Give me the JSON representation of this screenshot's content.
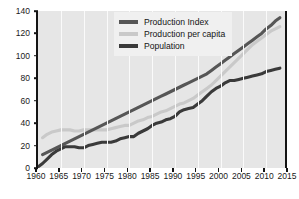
{
  "chart_data": {
    "type": "line",
    "title": "",
    "xlabel": "",
    "ylabel": "Production",
    "xlim": [
      1960,
      2015
    ],
    "ylim": [
      0,
      140
    ],
    "xticks": [
      1960,
      1965,
      1970,
      1975,
      1980,
      1985,
      1990,
      1995,
      2000,
      2005,
      2010,
      2015
    ],
    "yticks": [
      0,
      20,
      40,
      60,
      80,
      100,
      120,
      140
    ],
    "grid": "vertical",
    "legend_position": "top-center",
    "series": [
      {
        "name": "Production Index",
        "color": "#565656",
        "x": [
          1961,
          1962,
          1963,
          1964,
          1965,
          1966,
          1967,
          1968,
          1969,
          1970,
          1971,
          1972,
          1973,
          1974,
          1975,
          1976,
          1977,
          1978,
          1979,
          1980,
          1981,
          1982,
          1983,
          1984,
          1985,
          1986,
          1987,
          1988,
          1989,
          1990,
          1991,
          1992,
          1993,
          1994,
          1995,
          1996,
          1997,
          1998,
          1999,
          2000,
          2001,
          2002,
          2003,
          2004,
          2005,
          2006,
          2007,
          2008,
          2009,
          2010,
          2011,
          2012,
          2013
        ],
        "values": [
          12,
          14,
          16,
          18,
          20,
          22,
          24,
          26,
          28,
          30,
          32,
          34,
          36,
          38,
          40,
          42,
          44,
          46,
          48,
          50,
          52,
          54,
          56,
          58,
          60,
          62,
          64,
          66,
          68,
          70,
          72,
          74,
          76,
          78,
          80,
          82,
          84,
          87,
          90,
          93,
          96,
          99,
          102,
          105,
          108,
          111,
          114,
          117,
          120,
          124,
          127,
          131,
          134
        ]
      },
      {
        "name": "Production per capita",
        "color": "#c9c9c9",
        "x": [
          1961,
          1962,
          1963,
          1964,
          1965,
          1966,
          1967,
          1968,
          1969,
          1970,
          1971,
          1972,
          1973,
          1974,
          1975,
          1976,
          1977,
          1978,
          1979,
          1980,
          1981,
          1982,
          1983,
          1984,
          1985,
          1986,
          1987,
          1988,
          1989,
          1990,
          1991,
          1992,
          1993,
          1994,
          1995,
          1996,
          1997,
          1998,
          1999,
          2000,
          2001,
          2002,
          2003,
          2004,
          2005,
          2006,
          2007,
          2008,
          2009,
          2010,
          2011,
          2012,
          2013
        ],
        "values": [
          27,
          30,
          32,
          33,
          34,
          34,
          34,
          33,
          33,
          34,
          34,
          34,
          34,
          34,
          34,
          35,
          36,
          37,
          38,
          38,
          40,
          42,
          43,
          45,
          46,
          48,
          50,
          51,
          53,
          55,
          57,
          58,
          60,
          62,
          65,
          68,
          71,
          74,
          78,
          82,
          86,
          90,
          94,
          98,
          102,
          106,
          110,
          113,
          116,
          119,
          122,
          124,
          126
        ]
      },
      {
        "name": "Population",
        "color": "#3a3a3a",
        "x": [
          1960,
          1961,
          1962,
          1963,
          1964,
          1965,
          1966,
          1967,
          1968,
          1969,
          1970,
          1971,
          1972,
          1973,
          1974,
          1975,
          1976,
          1977,
          1978,
          1979,
          1980,
          1981,
          1982,
          1983,
          1984,
          1985,
          1986,
          1987,
          1988,
          1989,
          1990,
          1991,
          1992,
          1993,
          1994,
          1995,
          1996,
          1997,
          1998,
          1999,
          2000,
          2001,
          2002,
          2003,
          2004,
          2005,
          2006,
          2007,
          2008,
          2009,
          2010,
          2011,
          2012,
          2013
        ],
        "values": [
          1,
          4,
          8,
          12,
          15,
          17,
          19,
          19,
          19,
          18,
          18,
          20,
          21,
          22,
          23,
          23,
          23,
          24,
          26,
          27,
          28,
          28,
          31,
          33,
          35,
          38,
          40,
          41,
          43,
          44,
          46,
          50,
          52,
          53,
          54,
          57,
          60,
          64,
          68,
          71,
          73,
          76,
          78,
          78,
          79,
          80,
          81,
          82,
          83,
          84,
          86,
          87,
          88,
          89
        ]
      }
    ]
  },
  "legend": {
    "items": [
      {
        "label": "Production Index"
      },
      {
        "label": "Production per capita"
      },
      {
        "label": "Population"
      }
    ]
  },
  "axes": {
    "y_label": "Production"
  }
}
